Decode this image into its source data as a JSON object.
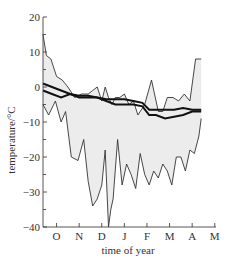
{
  "chart_data": {
    "type": "line",
    "title": "",
    "xlabel": "time of year",
    "ylabel": "temperature/°C",
    "ylim": [
      -40,
      20
    ],
    "yticks": [
      20,
      10,
      0,
      -10,
      -20,
      -30,
      -40
    ],
    "ytick_labels": [
      "20",
      "10",
      "0",
      "−10",
      "−20",
      "−30",
      "−40"
    ],
    "categories": [
      "O",
      "N",
      "D",
      "J",
      "F",
      "M",
      "A",
      "M"
    ],
    "grid": false,
    "legend": null,
    "x_unit": "month index (0 = start of Sep/Oct period, 1 = O tick)",
    "series": [
      {
        "name": "daily maximum (upper envelope)",
        "style": "thin",
        "x": [
          0,
          0.15,
          0.35,
          0.6,
          0.85,
          1.1,
          1.4,
          1.7,
          2.0,
          2.2,
          2.4,
          2.6,
          2.75,
          2.9,
          3.05,
          3.2,
          3.4,
          3.6,
          3.8,
          4.0,
          4.2,
          4.5,
          4.8,
          5.1,
          5.3,
          5.5,
          5.75,
          6.0,
          6.25,
          6.5,
          6.75,
          7.0
        ],
        "values": [
          15,
          9,
          8,
          3,
          2,
          0,
          -3,
          -2,
          -2,
          -1,
          0,
          -4,
          0,
          -3,
          -5,
          -3,
          -3,
          -2,
          -5,
          -4,
          -8,
          -5,
          2,
          -7,
          -7,
          -3,
          -3,
          -4,
          -2,
          -4,
          8,
          8
        ]
      },
      {
        "name": "daily minimum (lower envelope)",
        "style": "thin",
        "x": [
          0,
          0.25,
          0.55,
          0.8,
          1.0,
          1.25,
          1.55,
          1.8,
          2.0,
          2.2,
          2.4,
          2.6,
          2.75,
          2.9,
          3.0,
          3.1,
          3.3,
          3.5,
          3.7,
          3.9,
          4.1,
          4.3,
          4.5,
          4.7,
          4.9,
          5.1,
          5.3,
          5.5,
          5.7,
          5.9,
          6.1,
          6.3,
          6.5,
          6.7,
          6.9,
          7.0
        ],
        "values": [
          -5,
          -8,
          -4,
          -10,
          -7,
          -20,
          -21,
          -15,
          -27,
          -34,
          -32,
          -28,
          -18,
          -40,
          -35,
          -32,
          -15,
          -28,
          -22,
          -25,
          -29,
          -19,
          -25,
          -28,
          -24,
          -26,
          -22,
          -24,
          -28,
          -20,
          -20,
          -24,
          -18,
          -19,
          -14,
          -9
        ]
      },
      {
        "name": "mean temperature (upper thick line)",
        "style": "thick",
        "x": [
          0,
          0.4,
          0.8,
          1.2,
          1.6,
          2.0,
          2.4,
          2.8,
          3.2,
          3.6,
          4.0,
          4.4,
          4.7,
          5.0,
          5.4,
          5.8,
          6.2,
          6.6,
          7.0
        ],
        "values": [
          1,
          0,
          -1,
          -2,
          -2.5,
          -2.5,
          -3,
          -3.5,
          -3.5,
          -3.5,
          -4,
          -4.5,
          -6.5,
          -6.5,
          -6.5,
          -6.5,
          -6,
          -6.5,
          -6.5
        ]
      },
      {
        "name": "mean temperature (lower thick line)",
        "style": "thick",
        "x": [
          0,
          0.4,
          0.8,
          1.2,
          1.6,
          2.0,
          2.4,
          2.8,
          3.2,
          3.6,
          4.0,
          4.4,
          4.7,
          5.0,
          5.4,
          5.8,
          6.2,
          6.6,
          7.0
        ],
        "values": [
          -1,
          -2,
          -3,
          -2,
          -3,
          -3,
          -3,
          -4,
          -5,
          -5,
          -5,
          -5.5,
          -8,
          -8,
          -9,
          -8.5,
          -8,
          -7,
          -7
        ]
      }
    ]
  }
}
